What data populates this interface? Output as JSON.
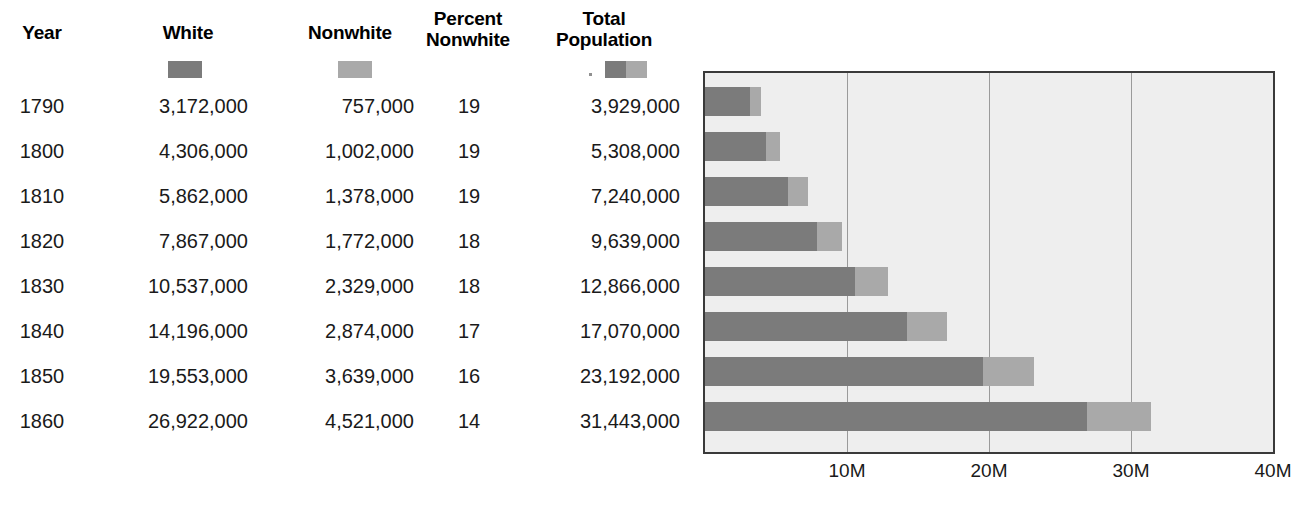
{
  "table": {
    "headers": {
      "year": "Year",
      "white": "White",
      "nonwhite": "Nonwhite",
      "percent_nonwhite": "Percent\nNonwhite",
      "total_population": "Total\nPopulation"
    },
    "rows": [
      {
        "year": "1790",
        "white": "3,172,000",
        "nonwhite": "757,000",
        "percent": "19",
        "total": "3,929,000"
      },
      {
        "year": "1800",
        "white": "4,306,000",
        "nonwhite": "1,002,000",
        "percent": "19",
        "total": "5,308,000"
      },
      {
        "year": "1810",
        "white": "5,862,000",
        "nonwhite": "1,378,000",
        "percent": "19",
        "total": "7,240,000"
      },
      {
        "year": "1820",
        "white": "7,867,000",
        "nonwhite": "1,772,000",
        "percent": "18",
        "total": "9,639,000"
      },
      {
        "year": "1830",
        "white": "10,537,000",
        "nonwhite": "2,329,000",
        "percent": "18",
        "total": "12,866,000"
      },
      {
        "year": "1840",
        "white": "14,196,000",
        "nonwhite": "2,874,000",
        "percent": "17",
        "total": "17,070,000"
      },
      {
        "year": "1850",
        "white": "19,553,000",
        "nonwhite": "3,639,000",
        "percent": "16",
        "total": "23,192,000"
      },
      {
        "year": "1860",
        "white": "26,922,000",
        "nonwhite": "4,521,000",
        "percent": "14",
        "total": "31,443,000"
      }
    ]
  },
  "legend": {
    "white_swatch_color": "#7b7b7b",
    "nonwhite_swatch_color": "#a9a9a9"
  },
  "chart_data": {
    "type": "bar",
    "orientation": "horizontal",
    "stacked": true,
    "title": "",
    "xlabel": "",
    "ylabel": "",
    "categories": [
      "1790",
      "1800",
      "1810",
      "1820",
      "1830",
      "1840",
      "1850",
      "1860"
    ],
    "series": [
      {
        "name": "White",
        "color": "#7b7b7b",
        "values": [
          3172000,
          4306000,
          5862000,
          7867000,
          10537000,
          14196000,
          19553000,
          26922000
        ]
      },
      {
        "name": "Nonwhite",
        "color": "#a9a9a9",
        "values": [
          757000,
          1002000,
          1378000,
          1772000,
          2329000,
          2874000,
          3639000,
          4521000
        ]
      }
    ],
    "totals": [
      3929000,
      5308000,
      7240000,
      9639000,
      12866000,
      17070000,
      23192000,
      31443000
    ],
    "xlim": [
      0,
      40000000
    ],
    "xticks": [
      10000000,
      20000000,
      30000000,
      40000000
    ],
    "xticklabels": [
      "10M",
      "20M",
      "30M",
      "40M"
    ],
    "grid": true,
    "legend_position": "table-header",
    "plot_background": "#eeeeee",
    "gridline_color": "#9a9a9a",
    "border_color": "#3a3a3a"
  }
}
